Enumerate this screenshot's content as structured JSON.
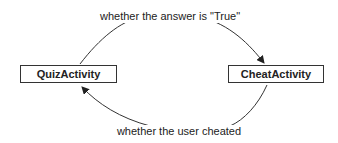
{
  "diagram": {
    "nodes": [
      {
        "id": "quiz",
        "label": "QuizActivity"
      },
      {
        "id": "cheat",
        "label": "CheatActivity"
      }
    ],
    "edges": [
      {
        "from": "quiz",
        "to": "cheat",
        "label": "whether the answer is \"True\""
      },
      {
        "from": "cheat",
        "to": "quiz",
        "label": "whether the user cheated"
      }
    ],
    "colors": {
      "stroke": "#333333",
      "text": "#222222",
      "background": "#ffffff"
    }
  }
}
